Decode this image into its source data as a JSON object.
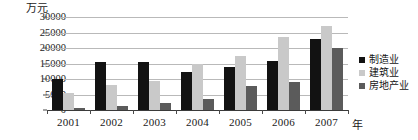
{
  "chart_data": {
    "type": "bar",
    "title": "",
    "unit_label": "万元",
    "xlabel": "年",
    "ylabel": "",
    "categories": [
      "2001",
      "2002",
      "2003",
      "2004",
      "2005",
      "2006",
      "2007"
    ],
    "yticks": [
      0,
      5000,
      10000,
      15000,
      20000,
      25000,
      30000
    ],
    "ylim": [
      0,
      30000
    ],
    "grid": true,
    "legend_position": "right",
    "series": [
      {
        "name": "制造业",
        "color": "#121212",
        "values": [
          10000,
          15500,
          15500,
          12300,
          13800,
          15800,
          23000
        ]
      },
      {
        "name": "建筑业",
        "color": "#c9c9c9",
        "values": [
          5400,
          8200,
          9200,
          14800,
          17300,
          23500,
          27200
        ]
      },
      {
        "name": "房地产业",
        "color": "#5b5b5b",
        "values": [
          500,
          1200,
          2400,
          3600,
          7800,
          9100,
          20000
        ]
      }
    ]
  }
}
